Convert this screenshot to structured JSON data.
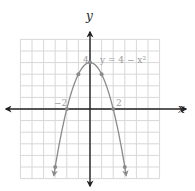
{
  "chart_data": {
    "type": "line",
    "title": "",
    "equation": "y = 4 − x²",
    "xlabel": "x",
    "ylabel": "y",
    "xlim": [
      -6,
      6
    ],
    "ylim": [
      -6,
      6
    ],
    "grid": true,
    "tick_labels": {
      "x": [
        "−2",
        "2"
      ],
      "y": [
        "4"
      ]
    },
    "series": [
      {
        "name": "y = 4 − x²",
        "x": [
          -3,
          -1,
          0,
          1,
          2,
          -2,
          3
        ],
        "y": [
          -5,
          3,
          4,
          3,
          0,
          0,
          -5
        ]
      }
    ],
    "points": [
      {
        "x": -3,
        "y": -5
      },
      {
        "x": -2,
        "y": 0
      },
      {
        "x": -1,
        "y": 3
      },
      {
        "x": 0,
        "y": 4
      },
      {
        "x": 1,
        "y": 3
      },
      {
        "x": 2,
        "y": 0
      },
      {
        "x": 3,
        "y": -5
      }
    ],
    "colors": {
      "curve": "#8a8a8a",
      "grid": "#d8d8d8",
      "axis": "#222222"
    }
  },
  "labels": {
    "x_axis": "x",
    "y_axis": "y",
    "equation": "y = 4 − x²",
    "tick_neg2": "−2",
    "tick_2": "2",
    "tick_4": "4"
  }
}
